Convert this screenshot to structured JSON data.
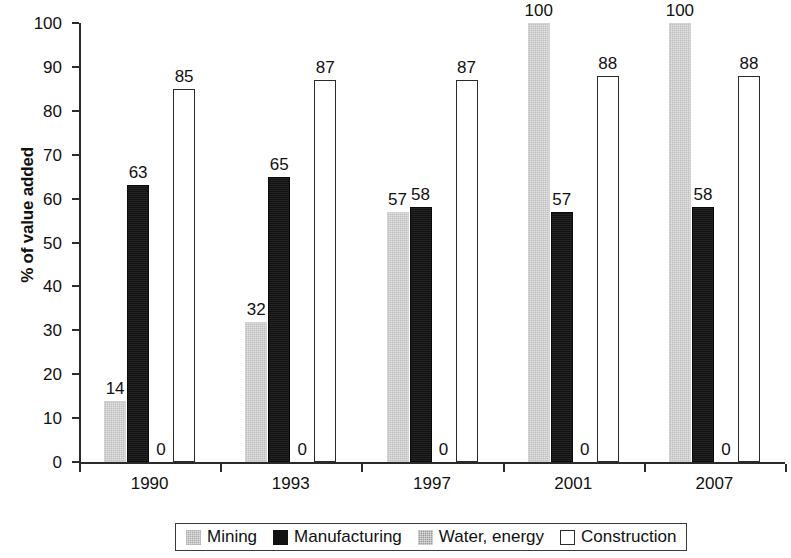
{
  "chart_data": {
    "type": "bar",
    "title": "",
    "subtitle": "",
    "xlabel": "",
    "ylabel": "% of value added",
    "categories": [
      "1990",
      "1993",
      "1997",
      "2001",
      "2007"
    ],
    "series": [
      {
        "name": "Mining",
        "color": "#e3e3e3",
        "values": [
          14,
          32,
          57,
          100,
          100
        ]
      },
      {
        "name": "Manufacturing",
        "color": "#121212",
        "values": [
          63,
          65,
          58,
          57,
          58
        ]
      },
      {
        "name": "Water, energy",
        "color": "#9a9a9a",
        "values": [
          0,
          0,
          0,
          0,
          0
        ]
      },
      {
        "name": "Construction",
        "color": "#ffffff",
        "values": [
          85,
          87,
          87,
          88,
          88
        ]
      }
    ],
    "ylim": [
      0,
      100
    ],
    "yticks": [
      0,
      10,
      20,
      30,
      40,
      50,
      60,
      70,
      80,
      90,
      100
    ],
    "ytick_labels": [
      "0",
      "10",
      "20",
      "30",
      "40",
      "50",
      "60",
      "70",
      "80",
      "90",
      "100"
    ],
    "data_labels": [
      {
        "category": "1990",
        "series": "Mining",
        "text": "14"
      },
      {
        "category": "1990",
        "series": "Manufacturing",
        "text": "63"
      },
      {
        "category": "1990",
        "series": "Water, energy",
        "text": "0"
      },
      {
        "category": "1990",
        "series": "Construction",
        "text": "85"
      },
      {
        "category": "1993",
        "series": "Mining",
        "text": "32"
      },
      {
        "category": "1993",
        "series": "Manufacturing",
        "text": "65"
      },
      {
        "category": "1993",
        "series": "Water, energy",
        "text": "0"
      },
      {
        "category": "1993",
        "series": "Construction",
        "text": "87"
      },
      {
        "category": "1997",
        "series": "Mining",
        "text": "57"
      },
      {
        "category": "1997",
        "series": "Manufacturing",
        "text": "58"
      },
      {
        "category": "1997",
        "series": "Water, energy",
        "text": "0"
      },
      {
        "category": "1997",
        "series": "Construction",
        "text": "87"
      },
      {
        "category": "2001",
        "series": "Mining",
        "text": "100"
      },
      {
        "category": "2001",
        "series": "Manufacturing",
        "text": "57"
      },
      {
        "category": "2001",
        "series": "Water, energy",
        "text": "0"
      },
      {
        "category": "2001",
        "series": "Construction",
        "text": "88"
      },
      {
        "category": "2007",
        "series": "Mining",
        "text": "100"
      },
      {
        "category": "2007",
        "series": "Manufacturing",
        "text": "58"
      },
      {
        "category": "2007",
        "series": "Water, energy",
        "text": "0"
      },
      {
        "category": "2007",
        "series": "Construction",
        "text": "88"
      }
    ],
    "grid": false,
    "legend_position": "bottom",
    "legend_entries": [
      "Mining",
      "Manufacturing",
      "Water, energy",
      "Construction"
    ]
  },
  "legend": {
    "items": [
      {
        "label": "Mining",
        "swatch": "mining-swatch"
      },
      {
        "label": "Manufacturing",
        "swatch": "manufacturing-swatch"
      },
      {
        "label": "Water, energy",
        "swatch": "water-energy-swatch"
      },
      {
        "label": "Construction",
        "swatch": "construction-swatch"
      }
    ]
  }
}
